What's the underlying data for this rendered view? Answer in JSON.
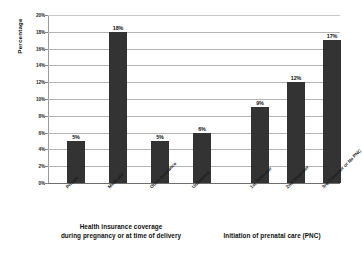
{
  "chart_data": {
    "type": "bar",
    "title": "",
    "xlabel": "",
    "ylabel": "Percentage",
    "ylim": [
      0,
      20
    ],
    "yunit": "%",
    "grid": true,
    "legend": false,
    "bar_color": "#333333",
    "gridline_color": "#b4b4b4",
    "background": "#ffffff",
    "ytick_labels": [
      "0%",
      "2%",
      "4%",
      "6%",
      "8%",
      "10%",
      "12%",
      "14%",
      "16%",
      "18%",
      "20%"
    ],
    "ytick_values": [
      0,
      2,
      4,
      6,
      8,
      10,
      12,
      14,
      16,
      18,
      20
    ],
    "categories": [
      "Private",
      "Medicaid",
      "Other Insurance",
      "Uninsured",
      "1st Trimester",
      "2nd Trimester",
      "3rd Trimester or No PNC"
    ],
    "values": [
      5,
      18,
      5,
      6,
      9,
      12,
      17
    ],
    "data_labels": [
      "5%",
      "18%",
      "5%",
      "6%",
      "9%",
      "12%",
      "17%"
    ],
    "groups": [
      {
        "caption_lines": [
          "Health insurance coverage",
          "during pregnancy or at time of delivery"
        ],
        "categories": [
          "Private",
          "Medicaid",
          "Other Insurance",
          "Uninsured"
        ],
        "values": [
          5,
          18,
          5,
          6
        ]
      },
      {
        "caption_lines": [
          "Initiation of prenatal care (PNC)"
        ],
        "categories": [
          "1st Trimester",
          "2nd Trimester",
          "3rd Trimester or No PNC"
        ],
        "values": [
          9,
          12,
          17
        ]
      }
    ]
  }
}
